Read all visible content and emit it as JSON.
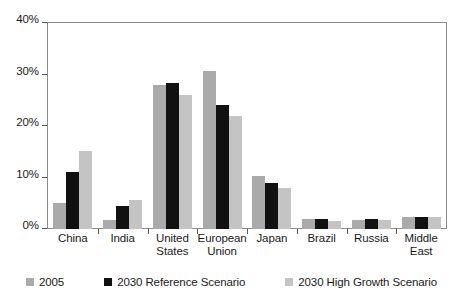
{
  "chart_data": {
    "type": "bar",
    "title": "",
    "subtitle": "",
    "xlabel": "",
    "ylabel": "",
    "ylim": [
      0,
      40
    ],
    "ytick_values": [
      0,
      10,
      20,
      30,
      40
    ],
    "ytick_labels": [
      "0%",
      "10%",
      "20%",
      "30%",
      "40%"
    ],
    "grid": false,
    "legend_position": "bottom",
    "value_unit": "%",
    "categories": [
      "China",
      "India",
      "United States",
      "European Union",
      "Japan",
      "Brazil",
      "Russia",
      "Middle East"
    ],
    "category_lines": [
      [
        "China"
      ],
      [
        "India"
      ],
      [
        "United",
        "States"
      ],
      [
        "European",
        "Union"
      ],
      [
        "Japan"
      ],
      [
        "Brazil"
      ],
      [
        "Russia"
      ],
      [
        "Middle",
        "East"
      ]
    ],
    "series": [
      {
        "name": "2005",
        "color": "#aaaaaa",
        "values": [
          5.0,
          1.8,
          28.0,
          30.7,
          10.2,
          2.0,
          1.8,
          2.3
        ]
      },
      {
        "name": "2030 Reference Scenario",
        "color": "#111111",
        "values": [
          11.1,
          4.5,
          28.3,
          24.0,
          9.0,
          1.9,
          1.9,
          2.4
        ]
      },
      {
        "name": "2030 High Growth Scenario",
        "color": "#c4c4c4",
        "values": [
          15.1,
          5.6,
          26.0,
          22.0,
          8.0,
          1.6,
          1.7,
          2.3
        ]
      }
    ]
  }
}
